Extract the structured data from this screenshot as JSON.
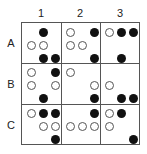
{
  "columns": [
    "1",
    "2",
    "3"
  ],
  "rows": [
    "A",
    "B",
    "C"
  ],
  "cells": {
    "A1": [
      [
        null,
        "filled",
        null
      ],
      [
        "open",
        "open",
        null
      ],
      [
        null,
        "filled",
        "filled"
      ]
    ],
    "A2": [
      [
        "open",
        null,
        "filled"
      ],
      [
        "open",
        "open",
        null
      ],
      [
        null,
        null,
        "filled"
      ]
    ],
    "A3": [
      [
        "open",
        "filled",
        "filled"
      ],
      [
        null,
        null,
        null
      ],
      [
        null,
        "filled",
        null
      ]
    ],
    "B1": [
      [
        "open",
        null,
        "filled"
      ],
      [
        "open",
        null,
        "open"
      ],
      [
        null,
        "filled",
        null
      ]
    ],
    "B2": [
      [
        "open",
        null,
        null
      ],
      [
        null,
        null,
        "open"
      ],
      [
        null,
        null,
        "filled"
      ]
    ],
    "B3": [
      [
        null,
        null,
        null
      ],
      [
        "open",
        null,
        null
      ],
      [
        null,
        "filled",
        "filled"
      ]
    ],
    "C1": [
      [
        "open",
        "filled",
        "filled"
      ],
      [
        null,
        "open",
        "open"
      ],
      [
        null,
        null,
        "filled"
      ]
    ],
    "C2": [
      [
        null,
        null,
        "filled"
      ],
      [
        "open",
        "open",
        "open"
      ],
      [
        null,
        null,
        null
      ]
    ],
    "C3": [
      [
        "open",
        "filled",
        null
      ],
      [
        "open",
        null,
        null
      ],
      [
        null,
        null,
        "filled"
      ]
    ]
  },
  "colors": {
    "filled": "#111111",
    "open_stroke": "#555555",
    "grid": "#555555"
  }
}
